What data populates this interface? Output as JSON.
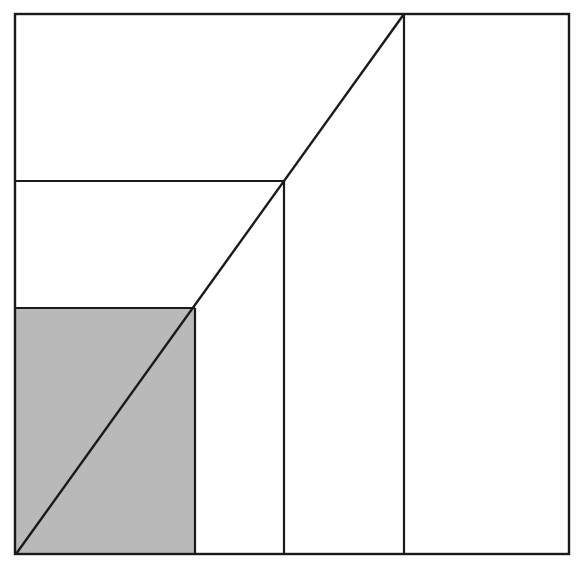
{
  "diagram": {
    "colors": {
      "stroke": "#1a1a1a",
      "shade": "#b9b9b9",
      "background": "#ffffff"
    },
    "outer_box": {
      "x1": 15,
      "y1": 14,
      "x2": 569,
      "y2": 554
    },
    "rectangles": [
      {
        "name": "large",
        "x2": 404,
        "y1": 14,
        "shaded": false
      },
      {
        "name": "medium",
        "x2": 284,
        "y1": 181,
        "shaded": false
      },
      {
        "name": "small",
        "x2": 195,
        "y1": 308,
        "shaded": true
      }
    ],
    "origin": {
      "x": 16,
      "y": 554
    },
    "diagonal": {
      "from": [
        16,
        554
      ],
      "to": [
        404,
        14
      ]
    }
  }
}
